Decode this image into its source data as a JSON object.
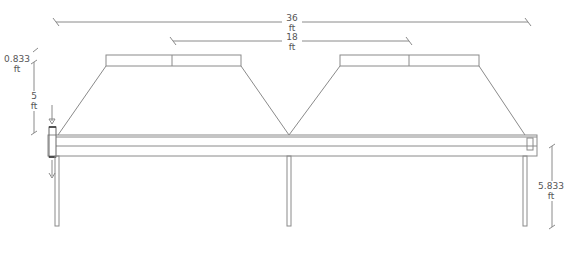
{
  "drawing": {
    "type": "elevation",
    "stroke_color": "#888888",
    "text_color": "#555555"
  },
  "dimensions": {
    "overall_span": {
      "value": "36",
      "unit": "ft"
    },
    "module_spacing": {
      "value": "18",
      "unit": "ft"
    },
    "cap_height": {
      "value": "0.833",
      "unit": "ft"
    },
    "hood_height": {
      "value": "5",
      "unit": "ft"
    },
    "clearance_height": {
      "value": "5.833",
      "unit": "ft"
    }
  }
}
